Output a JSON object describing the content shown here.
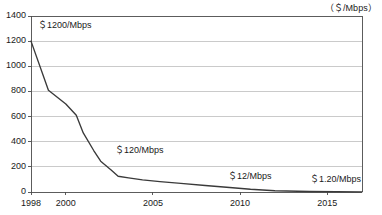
{
  "chart_data": {
    "type": "line",
    "title": "",
    "subtitle": "",
    "xlabel": "",
    "ylabel": "",
    "unit_label": "（＄/Mbps）",
    "grid": true,
    "legend": "none",
    "xlim": [
      1998,
      2017
    ],
    "ylim": [
      0,
      1400
    ],
    "ytick_labels": [
      "1400",
      "1200",
      "1000",
      "800",
      "600",
      "400",
      "200",
      "0"
    ],
    "ytick_values": [
      1400,
      1200,
      1000,
      800,
      600,
      400,
      200,
      0
    ],
    "xtick_labels": [
      "1998",
      "2000",
      "2005",
      "2010",
      "2015"
    ],
    "xtick_values": [
      1998,
      2000,
      2005,
      2010,
      2015
    ],
    "series": [
      {
        "name": "Bandwidth price",
        "color": "#3a3a3a",
        "x": [
          1998,
          1999,
          2000,
          2000.6,
          2001,
          2001.6,
          2002,
          2002.6,
          2003,
          2003.6,
          2004.4,
          2005.4,
          2006.6,
          2008,
          2009.4,
          2010.6,
          2012,
          2014,
          2017
        ],
        "values": [
          1200,
          810,
          700,
          610,
          470,
          330,
          245,
          175,
          125,
          112,
          96,
          82,
          68,
          52,
          36,
          22,
          10,
          4,
          1.2
        ]
      }
    ],
    "annotations": [
      {
        "text": "＄1200/Mbps",
        "x_px": 38,
        "y_px": 18,
        "near_value": 1200,
        "near_year": 1998
      },
      {
        "text": "＄120/Mbps",
        "x_px": 115,
        "y_px": 143,
        "near_value": 120,
        "near_year": 2003
      },
      {
        "text": "＄12/Mbps",
        "x_px": 228,
        "y_px": 169,
        "near_value": 12,
        "near_year": 2011
      },
      {
        "text": "＄1.20/Mbps",
        "x_px": 310,
        "y_px": 172,
        "near_value": 1.2,
        "near_year": 2016
      }
    ],
    "colors": {
      "line": "#3a3a3a",
      "grid": "#b4b4b4",
      "axis": "#4a4a4a",
      "text": "#1a1a1a",
      "background": "#ffffff"
    },
    "geometry": {
      "plot_left_px": 31,
      "plot_right_px": 362,
      "plot_top_px": 16,
      "plot_bottom_px": 192
    }
  }
}
